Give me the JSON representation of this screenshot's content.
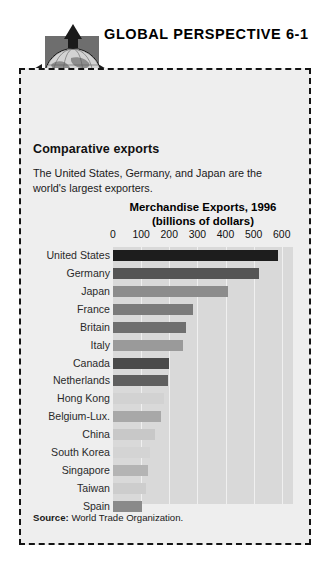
{
  "header": {
    "title": "GLOBAL PERSPECTIVE 6-1",
    "emblem_icon": "globe-with-four-arrows-icon"
  },
  "panel": {
    "heading": "Comparative exports",
    "blurb": "The United States, Germany, and Japan are the world's largest exporters.",
    "source_label": "Source:",
    "source_text": "World Trade Organization."
  },
  "chart_data": {
    "type": "bar",
    "orientation": "horizontal",
    "title": "Merchandise Exports, 1996\n(billions of dollars)",
    "title_line1": "Merchandise Exports, 1996",
    "title_line2": "(billions of dollars)",
    "xlabel": "billions of dollars",
    "ylabel": "",
    "xlim": [
      0,
      640
    ],
    "ticks": [
      0,
      100,
      200,
      300,
      400,
      500,
      600
    ],
    "tick_labels": [
      "0",
      "100",
      "200",
      "300",
      "400",
      "500",
      "600"
    ],
    "grid": true,
    "legend": "none",
    "categories": [
      "United States",
      "Germany",
      "Japan",
      "France",
      "Britain",
      "Italy",
      "Canada",
      "Netherlands",
      "Hong Kong",
      "Belgium-Lux.",
      "China",
      "South Korea",
      "Singapore",
      "Taiwan",
      "Spain"
    ],
    "values": [
      585,
      520,
      410,
      285,
      260,
      250,
      200,
      195,
      181,
      170,
      151,
      130,
      125,
      116,
      102
    ],
    "bar_colors": [
      "#1d1d1d",
      "#555555",
      "#8c8c8c",
      "#7b7b7b",
      "#6f6f6f",
      "#9a9a9a",
      "#4a4a4a",
      "#5f5f5f",
      "#d2d2d2",
      "#a8a8a8",
      "#c8c8c8",
      "#d4d4d4",
      "#b4b4b4",
      "#cdcdcd",
      "#8a8a8a"
    ],
    "plot_background": "#d9d9d9",
    "gridline_color": "#f0f0f0"
  },
  "colors": {
    "panel_background": "#eeeeee",
    "panel_border": "#141414",
    "emblem_square": "#6e6e6e",
    "arrow": "#1a1a1a",
    "text": "#111111"
  }
}
